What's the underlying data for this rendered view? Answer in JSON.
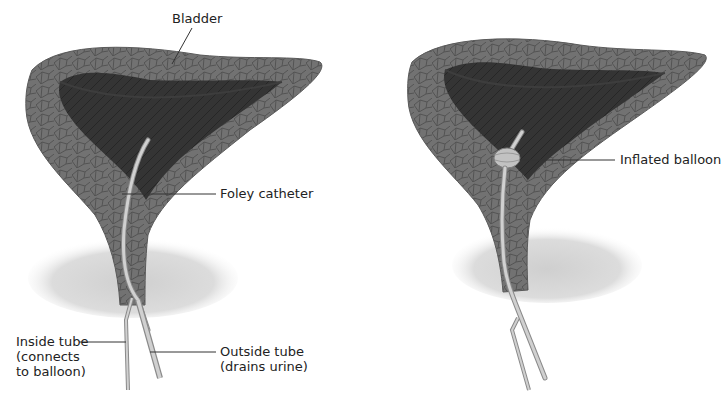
{
  "figure": {
    "panels": [
      {
        "id": "left",
        "description": "Foley catheter inserted in bladder, balloon deflated",
        "labels": {
          "bladder": "Bladder",
          "catheter": "Foley catheter",
          "inside_tube": "Inside tube\n(connects\nto balloon)",
          "outside_tube": "Outside tube\n(drains urine)"
        }
      },
      {
        "id": "right",
        "description": "Foley catheter with balloon inflated inside bladder",
        "labels": {
          "balloon": "Inflated balloon"
        }
      }
    ],
    "colors": {
      "bladder_wall": "#6e6e6e",
      "bladder_wall_lines": "#4a4a4a",
      "bladder_interior": "#2e2e2e",
      "prostate_shadow": "#d4d4d4",
      "catheter": "#c8c8c8",
      "catheter_edge": "#8a8a8a",
      "leader_line": "#333333",
      "text": "#222222"
    }
  }
}
